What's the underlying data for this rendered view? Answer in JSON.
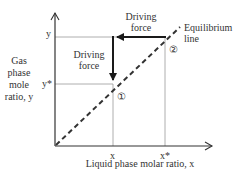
{
  "diagram": {
    "type": "equilibrium-diagram",
    "y_axis": {
      "label_lines": [
        "Gas",
        "phase",
        "mole",
        "ratio, y"
      ],
      "ticks": [
        "y",
        "y*"
      ]
    },
    "x_axis": {
      "label": "Liquid phase molar ratio, x",
      "ticks": [
        "x",
        "x*"
      ]
    },
    "equilibrium_line": {
      "label_lines": [
        "Equilibrium",
        "line"
      ],
      "style": "dashed"
    },
    "driving_forces": [
      {
        "label_lines": [
          "Driving",
          "force"
        ],
        "direction": "horizontal",
        "from": "x*",
        "to": "x",
        "at": "y"
      },
      {
        "label_lines": [
          "Driving",
          "force"
        ],
        "direction": "vertical",
        "from": "y",
        "to": "y*",
        "at": "x"
      }
    ],
    "points": [
      {
        "label": "①",
        "location": "(x, y*)"
      },
      {
        "label": "②",
        "location": "(x*, y)"
      }
    ],
    "colors": {
      "line": "#333333",
      "guide": "#9a9a9a",
      "arrow": "#1a1a1a"
    }
  }
}
